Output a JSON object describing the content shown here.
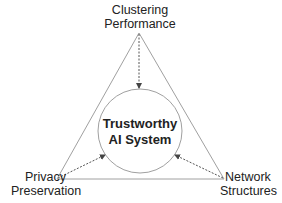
{
  "diagram": {
    "center": {
      "line1": "Trustworthy",
      "line2": "AI System"
    },
    "nodes": {
      "top": {
        "line1": "Clustering",
        "line2": "Performance"
      },
      "left": {
        "line1": "Privacy",
        "line2": "Preservation"
      },
      "right": {
        "line1": "Network",
        "line2": "Structures"
      }
    },
    "edges": [
      {
        "from": "Clustering Performance",
        "to": "Trustworthy AI System",
        "style": "dashed-arrow"
      },
      {
        "from": "Privacy Preservation",
        "to": "Trustworthy AI System",
        "style": "dashed-arrow"
      },
      {
        "from": "Network Structures",
        "to": "Trustworthy AI System",
        "style": "dashed-arrow"
      }
    ],
    "colors": {
      "line": "#9a9a9a",
      "arrow": "#555555",
      "text": "#222222"
    }
  }
}
